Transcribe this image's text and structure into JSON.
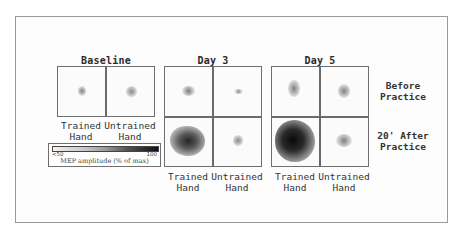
{
  "figure": {
    "columns": [
      {
        "title": "Baseline",
        "cells": [
          {
            "hand": "trained",
            "condition": "baseline",
            "map_extent": 0.15,
            "map_intensity": 0.35
          },
          {
            "hand": "untrained",
            "condition": "baseline",
            "map_extent": 0.18,
            "map_intensity": 0.35
          }
        ]
      },
      {
        "title": "Day 3",
        "cells": [
          {
            "hand": "trained",
            "condition": "before",
            "map_extent": 0.18,
            "map_intensity": 0.4
          },
          {
            "hand": "untrained",
            "condition": "before",
            "map_extent": 0.1,
            "map_intensity": 0.3
          },
          {
            "hand": "trained",
            "condition": "after",
            "map_extent": 0.6,
            "map_intensity": 0.8
          },
          {
            "hand": "untrained",
            "condition": "after",
            "map_extent": 0.18,
            "map_intensity": 0.35
          }
        ]
      },
      {
        "title": "Day 5",
        "cells": [
          {
            "hand": "trained",
            "condition": "before",
            "map_extent": 0.2,
            "map_intensity": 0.4
          },
          {
            "hand": "untrained",
            "condition": "before",
            "map_extent": 0.18,
            "map_intensity": 0.38
          },
          {
            "hand": "trained",
            "condition": "after",
            "map_extent": 0.75,
            "map_intensity": 0.95
          },
          {
            "hand": "untrained",
            "condition": "after",
            "map_extent": 0.25,
            "map_intensity": 0.4
          }
        ]
      }
    ],
    "hand_labels": {
      "trained_line1": "Trained",
      "trained_line2": "Hand",
      "untrained_line1": "Untrained",
      "untrained_line2": "Hand"
    },
    "row_labels": {
      "before_line1": "Before",
      "before_line2": "Practice",
      "after_line1": "20' After",
      "after_line2": "Practice"
    },
    "legend": {
      "min_label": "<50",
      "max_label": "100",
      "caption": "MEP amplitude (% of max)"
    }
  }
}
